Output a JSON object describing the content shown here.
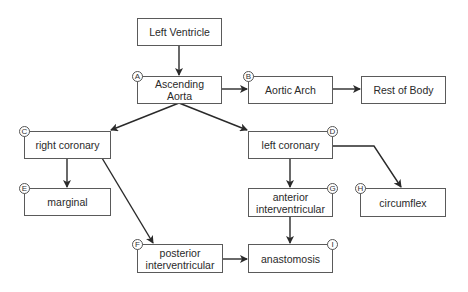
{
  "diagram": {
    "nodes": [
      {
        "id": "lv",
        "label": "Left Ventricle",
        "badge": ""
      },
      {
        "id": "aa",
        "label": "Ascending Aorta",
        "badge": "A"
      },
      {
        "id": "arch",
        "label": "Aortic Arch",
        "badge": "B"
      },
      {
        "id": "rob",
        "label": "Rest of Body",
        "badge": ""
      },
      {
        "id": "rc",
        "label": "right coronary",
        "badge": "C"
      },
      {
        "id": "lc",
        "label": "left coronary",
        "badge": "D"
      },
      {
        "id": "marg",
        "label": "marginal",
        "badge": "E"
      },
      {
        "id": "pi",
        "label": "posterior interventricular",
        "badge": "F"
      },
      {
        "id": "ai",
        "label": "anterior interventricular",
        "badge": "G"
      },
      {
        "id": "cx",
        "label": "circumflex",
        "badge": "H"
      },
      {
        "id": "ana",
        "label": "anastomosis",
        "badge": "I"
      }
    ],
    "edges": [
      {
        "from": "lv",
        "to": "aa"
      },
      {
        "from": "aa",
        "to": "arch"
      },
      {
        "from": "arch",
        "to": "rob"
      },
      {
        "from": "aa",
        "to": "rc"
      },
      {
        "from": "aa",
        "to": "lc"
      },
      {
        "from": "rc",
        "to": "marg"
      },
      {
        "from": "rc",
        "to": "pi"
      },
      {
        "from": "lc",
        "to": "ai"
      },
      {
        "from": "lc",
        "to": "cx"
      },
      {
        "from": "ai",
        "to": "ana"
      },
      {
        "from": "pi",
        "to": "ana"
      }
    ]
  }
}
